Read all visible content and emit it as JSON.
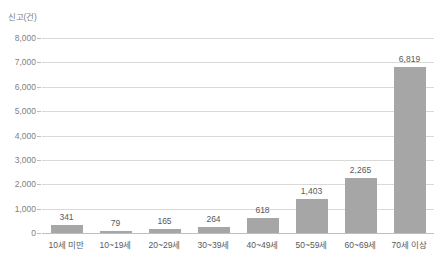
{
  "chart_data": {
    "type": "bar",
    "title": "",
    "subtitle": "",
    "xlabel": "",
    "ylabel": "신고(건)",
    "categories": [
      "10세 미만",
      "10~19세",
      "20~29세",
      "30~39세",
      "40~49세",
      "50~59세",
      "60~69세",
      "70세 이상"
    ],
    "values": [
      341,
      79,
      165,
      264,
      618,
      1403,
      2265,
      6819
    ],
    "value_labels": [
      "341",
      "79",
      "165",
      "264",
      "618",
      "1,403",
      "2,265",
      "6,819"
    ],
    "ylim": [
      0,
      8000
    ],
    "ytick_values": [
      0,
      1000,
      2000,
      3000,
      4000,
      5000,
      6000,
      7000,
      8000
    ],
    "ytick_labels": [
      "0",
      "1,000",
      "2,000",
      "3,000",
      "4,000",
      "5,000",
      "6,000",
      "7,000",
      "8,000"
    ],
    "grid": true,
    "legend": false,
    "legend_position": "none",
    "series": [
      {
        "name": "신고(건)",
        "values": [
          341,
          79,
          165,
          264,
          618,
          1403,
          2265,
          6819
        ]
      }
    ],
    "colors": {
      "bar_fill": "#a6a6a6",
      "gridline": "#d9d9d9",
      "axis_line": "#bfbfbf",
      "tick_text": "#7f7f7f",
      "label_text": "#595959",
      "background": "#ffffff"
    }
  }
}
